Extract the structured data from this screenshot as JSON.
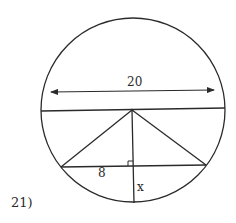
{
  "problem": {
    "number_label": "21)"
  },
  "diagram": {
    "labels": {
      "diameter": "20",
      "half_chord": "8",
      "unknown": "x"
    },
    "colors": {
      "stroke": "#2a2a2a",
      "background": "#ffffff"
    },
    "geometry": {
      "circle": {
        "cx": 133,
        "cy": 110,
        "r": 92
      },
      "diameter_line": {
        "x1": 41,
        "y1": 111,
        "x2": 225,
        "y2": 108
      },
      "dimension_arrow": {
        "x1": 51,
        "y1": 92,
        "x2": 214,
        "y2": 90
      },
      "center": {
        "x": 132,
        "y": 110
      },
      "chord": {
        "x1": 61,
        "y1": 167,
        "x2": 206,
        "y2": 165
      },
      "perpendicular": {
        "x1": 132,
        "y1": 110,
        "x2": 134,
        "y2": 203
      },
      "right_angle_mark": {
        "x": 128,
        "y": 161,
        "size": 5
      }
    }
  }
}
